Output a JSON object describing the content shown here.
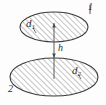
{
  "figure": {
    "type": "technical-diagram",
    "background_color": "#fdfdfd",
    "stroke_color": "#3a3a3a",
    "hatch_color": "#7a7a7a",
    "labels": {
      "upper_disc_diameter": "d",
      "upper_disc_diameter_sub": "1",
      "lower_disc_diameter": "d",
      "lower_disc_diameter_sub": "2",
      "separation": "h",
      "upper_disc_index": "1",
      "lower_disc_index": "2"
    },
    "shapes": {
      "upper_ellipse": {
        "cx": 54,
        "cy": 27,
        "rx": 34,
        "ry": 15
      },
      "lower_ellipse": {
        "cx": 54,
        "cy": 77,
        "rx": 44,
        "ry": 19
      },
      "dimension_line": {
        "x": 54,
        "y1": 24,
        "y2": 78
      }
    }
  }
}
